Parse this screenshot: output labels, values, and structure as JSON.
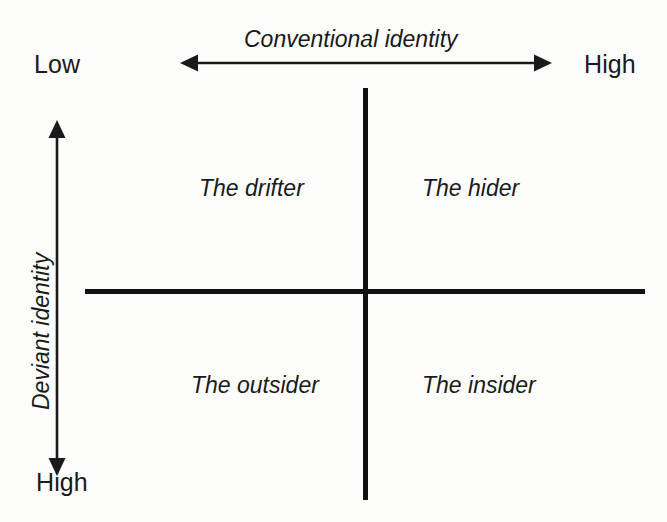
{
  "figure": {
    "type": "2x2-matrix",
    "background_color": "#fdfdfc",
    "ink_color": "#1a1a1a",
    "line_color": "#111111"
  },
  "x_axis": {
    "title": "Conventional identity",
    "low_label": "Low",
    "high_label": "High",
    "arrow_icon": "double-headed-horizontal-arrow-icon",
    "direction": "low-left-to-high-right"
  },
  "y_axis": {
    "title": "Deviant identity",
    "high_label": "High",
    "arrow_icon": "double-headed-vertical-arrow-icon",
    "direction": "high-at-bottom",
    "rotation_degrees": -90
  },
  "quadrants": [
    {
      "position": "top-left",
      "label": "The drifter"
    },
    {
      "position": "top-right",
      "label": "The hider"
    },
    {
      "position": "bottom-left",
      "label": "The outsider"
    },
    {
      "position": "bottom-right",
      "label": "The insider"
    }
  ]
}
